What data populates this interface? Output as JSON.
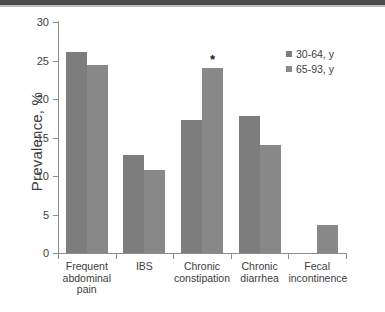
{
  "chart_data": {
    "type": "bar",
    "title": "",
    "subtitle": "",
    "xlabel": "",
    "ylabel": "Prevalence, %",
    "ylim": [
      0,
      30
    ],
    "yticks": [
      0,
      5,
      10,
      15,
      20,
      25,
      30
    ],
    "ytick_labels": [
      "0",
      "5",
      "10",
      "15",
      "20",
      "25",
      "30"
    ],
    "grid": false,
    "legend_position": "top-right",
    "categories": [
      "Frequent abdominal pain",
      "IBS",
      "Chronic constipation",
      "Chronic diarrhea",
      "Fecal incontinence"
    ],
    "category_label_lines": [
      [
        "Frequent",
        "abdominal",
        "pain"
      ],
      [
        "IBS"
      ],
      [
        "Chronic",
        "constipation"
      ],
      [
        "Chronic",
        "diarrhea"
      ],
      [
        "Fecal",
        "incontinence"
      ]
    ],
    "series": [
      {
        "name": "30-64, y",
        "color": "#7d7d7d",
        "values": [
          26.1,
          12.7,
          17.3,
          17.8,
          0
        ]
      },
      {
        "name": "65-93, y",
        "color": "#888888",
        "values": [
          24.4,
          10.8,
          24.0,
          14.0,
          3.6
        ]
      }
    ],
    "annotations": [
      {
        "text": "*",
        "category": "Chronic constipation",
        "series": "65-93, y",
        "value": 24.0,
        "meaning": "significance-marker"
      }
    ]
  },
  "legend": {
    "entries": [
      {
        "label": "30-64, y"
      },
      {
        "label": "65-93, y"
      }
    ]
  }
}
